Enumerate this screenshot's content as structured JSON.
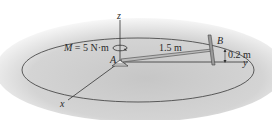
{
  "diagram": {
    "type": "statics-3d-figure",
    "labels": {
      "moment": "M = 5 N·m",
      "point_a": "A",
      "point_b": "B",
      "length_ab": "1.5 m",
      "height_b": "0.2 m",
      "axis_x": "x",
      "axis_y": "y",
      "axis_z": "z"
    },
    "colors": {
      "background_shade": "#c8c8c8",
      "line": "#3a3a3a",
      "text": "#2a2a2a"
    }
  }
}
